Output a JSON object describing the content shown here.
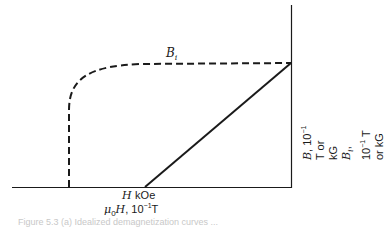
{
  "figure": {
    "curve_label_symbol": "B",
    "curve_label_sub": "i",
    "x_axis": {
      "line1_symbol": "H",
      "line1_unit": "kOe",
      "line2_prefix": "μ",
      "line2_sub": "0",
      "line2_symbol": "H",
      "line2_unit_base": ", 10",
      "line2_unit_exp": "−1",
      "line2_unit_suffix": "T"
    },
    "y_axis": {
      "line1_symbol": "B",
      "line1_unit_base": ", 10",
      "line1_unit_exp": "−1",
      "line1_unit_suffix": " T or kG",
      "line2_symbol": "B",
      "line2_sub": "i",
      "line2_unit_base": ", 10",
      "line2_unit_exp": "−1",
      "line2_unit_suffix": " T or kG"
    },
    "caption": "Figure 5.3   (a) Idealized demagnetization curves ...",
    "colors": {
      "ink": "#1a1a1a",
      "background": "#ffffff"
    },
    "curves": [
      {
        "name": "B_i (intrinsic)",
        "style": "dashed",
        "description": "vertical at coercivity, knee, then flat saturation to B-axis"
      },
      {
        "name": "B (normal)",
        "style": "solid",
        "description": "straight line from H-axis intercept to B-axis at remanence"
      }
    ]
  }
}
